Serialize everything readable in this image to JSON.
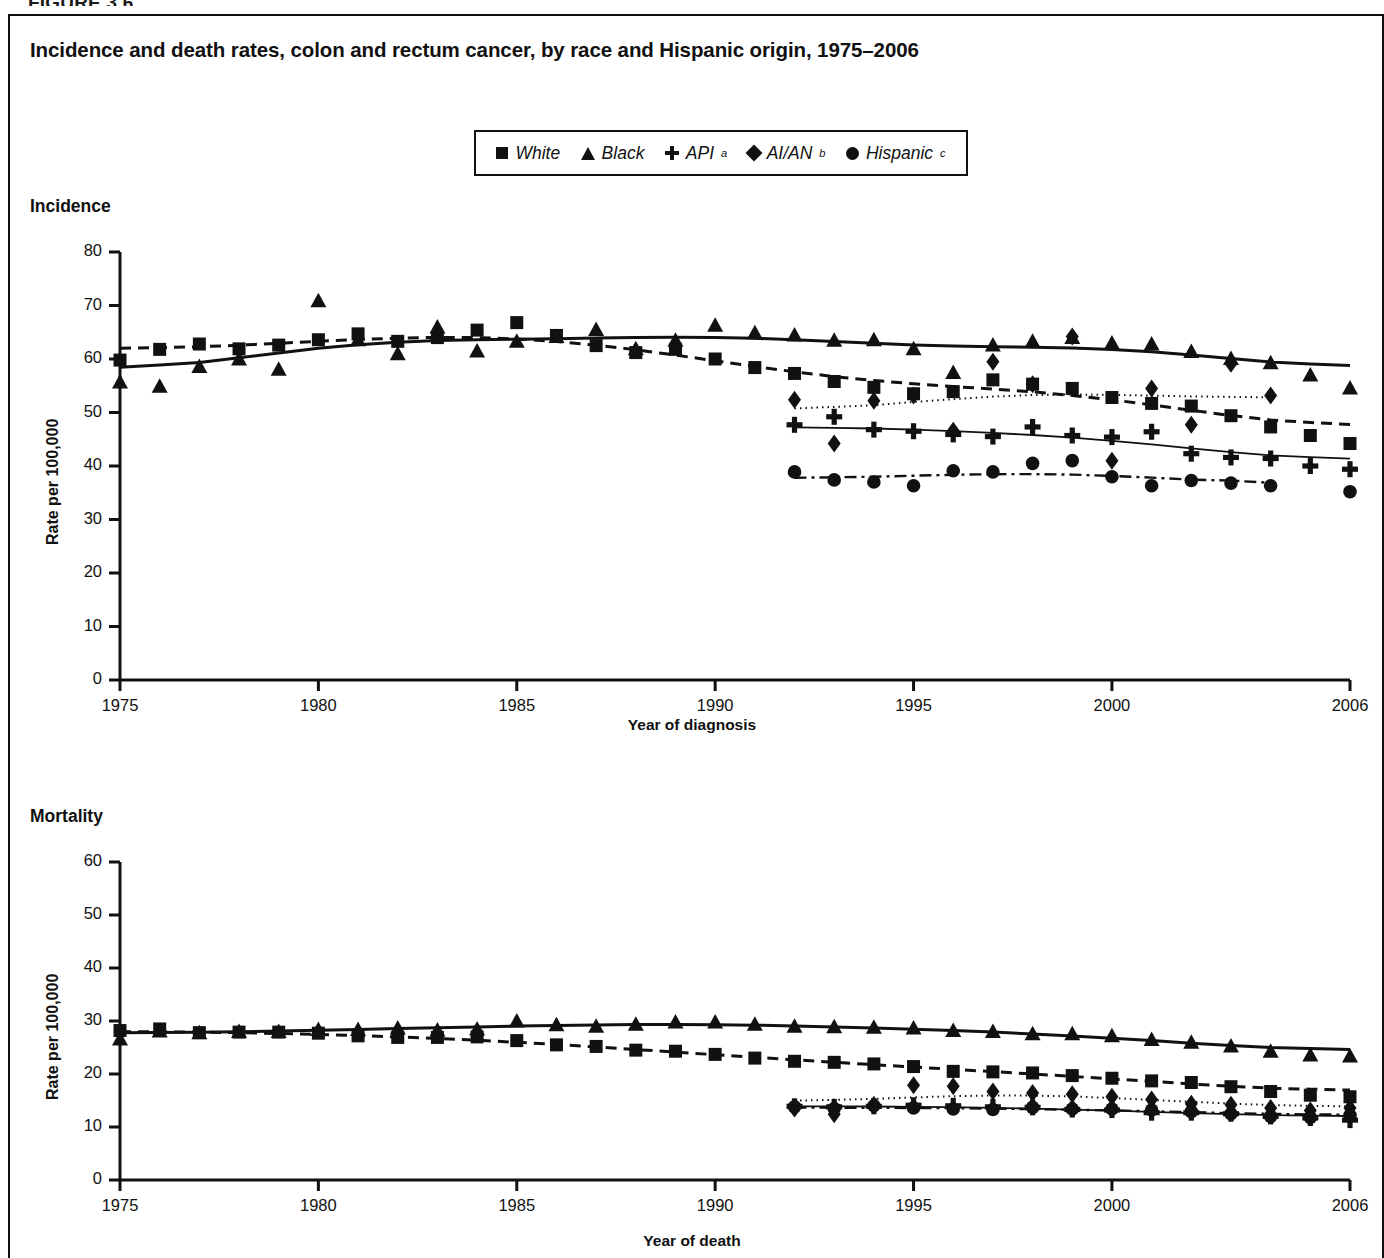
{
  "figure": {
    "number": "FIGURE 3.6"
  },
  "title": "Incidence and death rates, colon and rectum cancer, by race  and Hispanic origin, 1975–2006",
  "legend": {
    "items": [
      {
        "label": "White",
        "marker": "square",
        "sup": ""
      },
      {
        "label": "Black",
        "marker": "triangle",
        "sup": ""
      },
      {
        "label": "API",
        "marker": "plus",
        "sup": "a"
      },
      {
        "label": "AI/AN",
        "marker": "diamond",
        "sup": "b"
      },
      {
        "label": "Hispanic",
        "marker": "circle",
        "sup": "c"
      }
    ]
  },
  "panels": {
    "incidence": {
      "label": "Incidence"
    },
    "mortality": {
      "label": "Mortality"
    }
  },
  "colors": {
    "ink": "#111111",
    "background": "#ffffff"
  },
  "chart_data": [
    {
      "type": "line",
      "title": "Incidence",
      "xlabel": "Year of diagnosis",
      "ylabel": "Rate per 100,000",
      "xlim": [
        1975,
        2006
      ],
      "ylim": [
        0,
        80
      ],
      "yticks": [
        0,
        10,
        20,
        30,
        40,
        50,
        60,
        70,
        80
      ],
      "xticks": [
        1975,
        1980,
        1985,
        1990,
        1995,
        2000,
        2006
      ],
      "grid": false,
      "legend_position": "top-center",
      "x": [
        1975,
        1976,
        1977,
        1978,
        1979,
        1980,
        1981,
        1982,
        1983,
        1984,
        1985,
        1986,
        1987,
        1988,
        1989,
        1990,
        1991,
        1992,
        1993,
        1994,
        1995,
        1996,
        1997,
        1998,
        1999,
        2000,
        2001,
        2002,
        2003,
        2004,
        2005,
        2006
      ],
      "series": [
        {
          "name": "White",
          "marker": "square",
          "linestyle": "dashed",
          "values": [
            59.8,
            61.8,
            62.8,
            61.9,
            62.6,
            63.6,
            64.7,
            63.3,
            64.0,
            65.4,
            66.8,
            64.4,
            62.5,
            61.2,
            61.8,
            60.0,
            58.4,
            57.3,
            55.8,
            54.7,
            53.5,
            53.9,
            56.1,
            55.3,
            54.5,
            52.8,
            51.7,
            51.2,
            49.4,
            47.3,
            45.7,
            44.2
          ]
        },
        {
          "name": "Black",
          "marker": "triangle",
          "linestyle": "solid",
          "values": [
            55.7,
            54.9,
            58.6,
            60.0,
            58.1,
            70.9,
            63.6,
            61.0,
            66.0,
            61.5,
            63.3,
            64.2,
            65.5,
            61.9,
            63.5,
            66.3,
            64.9,
            64.5,
            63.5,
            63.6,
            61.9,
            57.5,
            62.6,
            63.3,
            64.0,
            63.0,
            62.8,
            61.4,
            60.1,
            59.3,
            57.0,
            54.6
          ]
        },
        {
          "name": "API",
          "marker": "plus",
          "linestyle": "thin-solid",
          "values": [
            null,
            null,
            null,
            null,
            null,
            null,
            null,
            null,
            null,
            null,
            null,
            null,
            null,
            null,
            null,
            null,
            null,
            47.7,
            49.2,
            46.8,
            46.5,
            45.9,
            45.5,
            47.3,
            45.7,
            45.4,
            46.4,
            42.3,
            41.6,
            41.4,
            40.0,
            39.4
          ]
        },
        {
          "name": "AI/AN",
          "marker": "diamond",
          "linestyle": "dotted",
          "values": [
            null,
            null,
            null,
            null,
            null,
            null,
            null,
            null,
            null,
            null,
            null,
            null,
            null,
            null,
            null,
            null,
            null,
            52.4,
            44.2,
            52.2,
            53.2,
            46.6,
            59.5,
            55.3,
            64.2,
            41.0,
            54.5,
            47.7,
            59.1,
            53.2,
            null,
            null
          ]
        },
        {
          "name": "Hispanic",
          "marker": "circle",
          "linestyle": "dashdot",
          "values": [
            null,
            null,
            null,
            null,
            null,
            null,
            null,
            null,
            null,
            null,
            null,
            null,
            null,
            null,
            null,
            null,
            null,
            38.9,
            37.4,
            37.0,
            36.3,
            39.1,
            38.9,
            40.5,
            41.0,
            38.0,
            36.3,
            37.3,
            36.8,
            36.3,
            null,
            35.2
          ]
        }
      ]
    },
    {
      "type": "line",
      "title": "Mortality",
      "xlabel": "Year of death",
      "ylabel": "Rate per 100,000",
      "xlim": [
        1975,
        2006
      ],
      "ylim": [
        0,
        60
      ],
      "yticks": [
        0,
        10,
        20,
        30,
        40,
        50,
        60
      ],
      "xticks": [
        1975,
        1980,
        1985,
        1990,
        1995,
        2000,
        2006
      ],
      "grid": false,
      "legend_position": "top-center",
      "x": [
        1975,
        1976,
        1977,
        1978,
        1979,
        1980,
        1981,
        1982,
        1983,
        1984,
        1985,
        1986,
        1987,
        1988,
        1989,
        1990,
        1991,
        1992,
        1993,
        1994,
        1995,
        1996,
        1997,
        1998,
        1999,
        2000,
        2001,
        2002,
        2003,
        2004,
        2005,
        2006
      ],
      "series": [
        {
          "name": "White",
          "marker": "square",
          "linestyle": "dashed",
          "values": [
            28.2,
            28.5,
            27.8,
            27.9,
            27.9,
            27.7,
            27.2,
            26.9,
            26.9,
            27.0,
            26.3,
            25.5,
            25.2,
            24.5,
            24.3,
            23.7,
            23.0,
            22.4,
            22.2,
            21.9,
            21.4,
            20.5,
            20.4,
            20.2,
            19.7,
            19.2,
            18.7,
            18.4,
            17.6,
            16.7,
            16.0,
            15.7
          ]
        },
        {
          "name": "Black",
          "marker": "triangle",
          "linestyle": "solid",
          "values": [
            26.6,
            28.1,
            27.8,
            28.0,
            28.0,
            28.4,
            28.4,
            28.7,
            28.3,
            28.5,
            30.0,
            29.3,
            29.0,
            29.4,
            29.8,
            29.8,
            29.4,
            29.0,
            28.9,
            28.8,
            28.7,
            28.2,
            28.0,
            27.6,
            27.6,
            27.2,
            26.5,
            26.0,
            25.3,
            24.3,
            23.6,
            23.4
          ]
        },
        {
          "name": "API",
          "marker": "plus",
          "linestyle": "thin-solid",
          "values": [
            null,
            null,
            null,
            null,
            null,
            null,
            null,
            null,
            null,
            null,
            null,
            null,
            null,
            null,
            null,
            null,
            null,
            13.9,
            13.8,
            13.9,
            14.1,
            14.0,
            13.8,
            13.7,
            13.3,
            13.2,
            12.7,
            12.7,
            12.5,
            12.0,
            11.7,
            11.3
          ]
        },
        {
          "name": "AI/AN",
          "marker": "diamond",
          "linestyle": "dotted",
          "values": [
            null,
            null,
            null,
            null,
            null,
            null,
            null,
            null,
            null,
            null,
            null,
            null,
            null,
            null,
            null,
            null,
            null,
            13.5,
            12.4,
            14.2,
            17.9,
            17.7,
            16.7,
            16.4,
            16.2,
            15.7,
            15.2,
            14.4,
            14.2,
            13.6,
            13.1,
            13.6
          ]
        },
        {
          "name": "Hispanic",
          "marker": "circle",
          "linestyle": "dashdot",
          "values": [
            null,
            null,
            null,
            null,
            null,
            null,
            null,
            null,
            null,
            null,
            null,
            null,
            null,
            null,
            null,
            null,
            null,
            13.8,
            13.5,
            14.0,
            13.6,
            13.4,
            13.3,
            13.7,
            13.4,
            13.4,
            13.2,
            12.9,
            12.5,
            12.0,
            11.8,
            12.2
          ]
        }
      ]
    }
  ]
}
